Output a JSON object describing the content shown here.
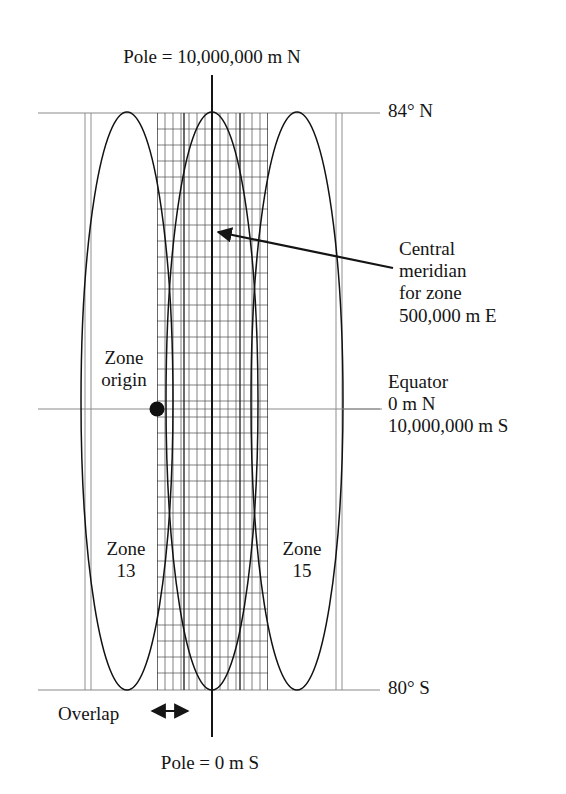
{
  "figure": {
    "type": "diagram",
    "colors": {
      "ink": "#151515",
      "graticule": "#8a8a8a",
      "grid": "#2b2b2b",
      "ellipse": "#1a1a1a",
      "background": "#ffffff"
    }
  },
  "labels": {
    "pole_north": "Pole = 10,000,000 m N",
    "pole_south": "Pole = 0 m S",
    "latitude_north": "84° N",
    "latitude_south": "80° S",
    "central_meridian": "Central\nmeridian\nfor zone\n500,000 m E",
    "equator": "Equator\n0 m N\n10,000,000 m S",
    "zone_origin": "Zone\norigin",
    "zone_left": "Zone\n13",
    "zone_right": "Zone\n15",
    "overlap": "Overlap"
  },
  "geometry": {
    "canvas": {
      "width": 566,
      "height": 794
    },
    "latitude_lines": [
      {
        "name": "84N",
        "y": 113,
        "x1": 38,
        "x2": 380
      },
      {
        "name": "equator",
        "y": 409,
        "x1": 38,
        "x2": 380
      },
      {
        "name": "80S",
        "y": 690,
        "x1": 38,
        "x2": 380
      }
    ],
    "zone_boundaries_x": [
      85,
      91,
      336,
      342
    ],
    "central_meridian": {
      "x": 212,
      "y1": 75,
      "y2": 737
    },
    "zones": [
      {
        "name": "13",
        "cx": 127,
        "rx": 46,
        "ry": 289,
        "cy": 401
      },
      {
        "name": "14",
        "cx": 212,
        "rx": 46,
        "ry": 289,
        "cy": 401
      },
      {
        "name": "15",
        "cx": 297,
        "rx": 46,
        "ry": 289,
        "cy": 401
      }
    ],
    "grid_region": {
      "x1": 157,
      "x2": 268,
      "y1": 113,
      "y2": 690,
      "cols": 14,
      "rows": 36
    },
    "zone_origin_point": {
      "x": 157,
      "y": 409,
      "r": 7
    },
    "overlap_arrow": {
      "x1": 150,
      "x2": 190,
      "y": 711
    },
    "pointer_arrow": {
      "tip_x": 214,
      "tip_y": 231,
      "tail_x": 393,
      "tail_y": 268
    }
  }
}
